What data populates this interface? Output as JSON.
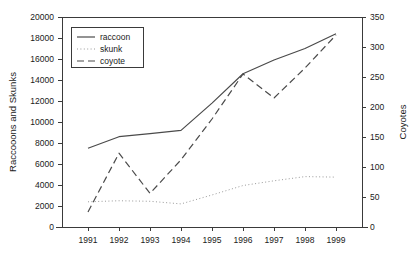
{
  "chart_data": {
    "type": "line",
    "title": "",
    "xlabel": "",
    "ylabel": "Raccooons and Skunks",
    "y2label": "Coyotes",
    "categories": [
      "1991",
      "1992",
      "1993",
      "1994",
      "1995",
      "1996",
      "1997",
      "1998",
      "1999"
    ],
    "ylim": [
      0,
      20000
    ],
    "y2lim": [
      0,
      350
    ],
    "yticks": [
      "0",
      "2000",
      "4000",
      "6000",
      "8000",
      "10000",
      "12000",
      "14000",
      "16000",
      "18000",
      "20000"
    ],
    "y2ticks": [
      "0",
      "50",
      "100",
      "150",
      "200",
      "250",
      "300",
      "350"
    ],
    "grid": false,
    "legend_position": "upper-left",
    "series": [
      {
        "name": "raccoon",
        "axis": "left",
        "style": "solid",
        "values": [
          7500,
          8600,
          8900,
          9200,
          11800,
          14600,
          15900,
          17000,
          18400
        ]
      },
      {
        "name": "skunk",
        "axis": "left",
        "style": "dotted",
        "values": [
          2400,
          2500,
          2450,
          2200,
          3050,
          3950,
          4400,
          4800,
          4750
        ]
      },
      {
        "name": "coyote",
        "axis": "right",
        "style": "dashed",
        "values": [
          25,
          123,
          56,
          112,
          180,
          255,
          215,
          265,
          320
        ]
      }
    ]
  },
  "legend": {
    "items": [
      {
        "label": "raccoon"
      },
      {
        "label": "skunk"
      },
      {
        "label": "coyote"
      }
    ]
  },
  "colors": {
    "raccoon": "#4a4a4a",
    "skunk": "#9a9a9a",
    "coyote": "#4a4a4a",
    "axis": "#3a3a3a",
    "text": "#1a1a1a",
    "background": "#ffffff"
  }
}
